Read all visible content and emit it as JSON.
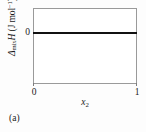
{
  "figure": {
    "caption": "(a)",
    "background_color": "#fdfdfd",
    "plot_background_color": "#ffffff",
    "frame_color": "#9a9a9a",
    "line_color": "#111111"
  },
  "axes": {
    "y": {
      "label_parts": {
        "delta": "Δ",
        "sub": "mix",
        "quantity": "H",
        "units": " (J mol",
        "exponent": "−1",
        "units_close": ")"
      },
      "label_plain": "ΔmixH (J mol−1)",
      "ticks": [
        "0"
      ]
    },
    "x": {
      "label_parts": {
        "symbol": "x",
        "sub": "2"
      },
      "label_plain": "x2",
      "ticks": [
        "0",
        "1"
      ]
    }
  },
  "chart_data": {
    "type": "line",
    "title": "",
    "subtitle": "",
    "xlabel": "x₂",
    "ylabel": "ΔmixH (J mol⁻¹)",
    "xlim": [
      0,
      1
    ],
    "ylim": [
      -0.75,
      0.25
    ],
    "xticks": [
      0,
      1
    ],
    "xticklabels": [
      "0",
      "1"
    ],
    "yticks": [
      0
    ],
    "yticklabels": [
      "0"
    ],
    "grid": false,
    "legend": null,
    "annotations": [
      "(a)"
    ],
    "series": [
      {
        "name": "ideal solution enthalpy of mixing",
        "x": [
          0,
          0.1,
          0.2,
          0.3,
          0.4,
          0.5,
          0.6,
          0.7,
          0.8,
          0.9,
          1
        ],
        "values": [
          0,
          0,
          0,
          0,
          0,
          0,
          0,
          0,
          0,
          0,
          0
        ],
        "color": "#111111",
        "linewidth": 2.4
      }
    ]
  }
}
